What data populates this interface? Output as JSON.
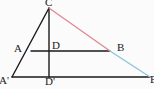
{
  "figure": {
    "type": "geometry-diagram",
    "width": 154,
    "height": 89,
    "background_color": "#fbfbfb"
  },
  "colors": {
    "stroke_black": "#1a1a1a",
    "stroke_pink": "#e08a96",
    "stroke_blue": "#8fc4de",
    "label_text": "#1a1a1a"
  },
  "points": {
    "C": {
      "label": "C",
      "x": 49,
      "y": 8
    },
    "A": {
      "label": "A",
      "x": 31,
      "y": 51
    },
    "D": {
      "label": "D",
      "x": 49,
      "y": 51
    },
    "B": {
      "label": "B",
      "x": 110,
      "y": 51
    },
    "A2": {
      "label": "A'",
      "x": 12,
      "y": 77
    },
    "D2": {
      "label": "D'",
      "x": 49,
      "y": 77
    },
    "B2": {
      "label": "B'",
      "x": 150,
      "y": 77
    }
  },
  "labels": [
    {
      "name": "label-C",
      "text": "C",
      "left": 45,
      "top": -3
    },
    {
      "name": "label-A",
      "text": "A",
      "left": 14,
      "top": 43
    },
    {
      "name": "label-D",
      "text": "D",
      "left": 52,
      "top": 40
    },
    {
      "name": "label-B",
      "text": "B",
      "left": 117,
      "top": 42
    },
    {
      "name": "label-A-prime",
      "text": "A'",
      "left": -1,
      "top": 75
    },
    {
      "name": "label-D-prime",
      "text": "D'",
      "left": 45,
      "top": 76
    },
    {
      "name": "label-B-prime",
      "text": "B'",
      "left": 150,
      "top": 74
    }
  ],
  "segments": [
    {
      "name": "segment-A-prime-to-C",
      "from": "A2",
      "to": "C",
      "color_key": "stroke_black",
      "width": 1.4
    },
    {
      "name": "segment-C-to-D-prime",
      "from": "C",
      "to": "D2",
      "color_key": "stroke_black",
      "width": 1.4
    },
    {
      "name": "segment-A-prime-to-B-prime",
      "from": "A2",
      "to": "B2",
      "color_key": "stroke_black",
      "width": 1.4
    },
    {
      "name": "segment-A-to-B",
      "from": "A",
      "to": "B",
      "color_key": "stroke_black",
      "width": 1.4
    },
    {
      "name": "segment-C-to-B",
      "from": "C",
      "to": "B",
      "color_key": "stroke_pink",
      "width": 1.4
    },
    {
      "name": "segment-B-to-B-prime",
      "from": "B",
      "to": "B2",
      "color_key": "stroke_blue",
      "width": 1.4
    }
  ]
}
